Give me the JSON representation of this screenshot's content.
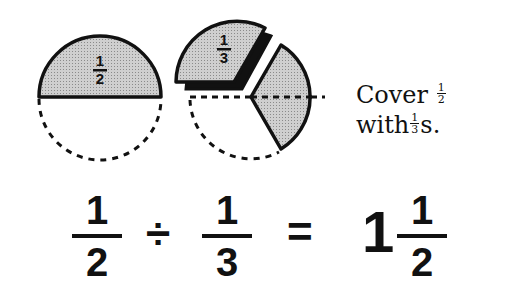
{
  "figure": {
    "left_circle": {
      "label_numerator": "1",
      "label_denominator": "2",
      "shaded": "top half",
      "outline_bottom": "dashed"
    },
    "right_circle": {
      "label_numerator": "1",
      "label_denominator": "3",
      "pieces": [
        "1/3 sector (top-left, lifted with shadow)",
        "1/3 sector (right, shaded)"
      ],
      "dashed_guides": [
        "horizontal diameter",
        "lower-left arc"
      ]
    },
    "colors": {
      "shade": "#c8c8c8",
      "ink": "#111111",
      "background": "#ffffff"
    }
  },
  "caption": {
    "line1_text": "Cover",
    "line1_frac_num": "1",
    "line1_frac_den": "2",
    "line2_text": "with",
    "line2_frac_num": "1",
    "line2_frac_den": "3",
    "line2_suffix": "s."
  },
  "equation": {
    "term1_num": "1",
    "term1_den": "2",
    "operator": "÷",
    "term2_num": "1",
    "term2_den": "3",
    "equals": "=",
    "result_whole": "1",
    "result_num": "1",
    "result_den": "2"
  }
}
